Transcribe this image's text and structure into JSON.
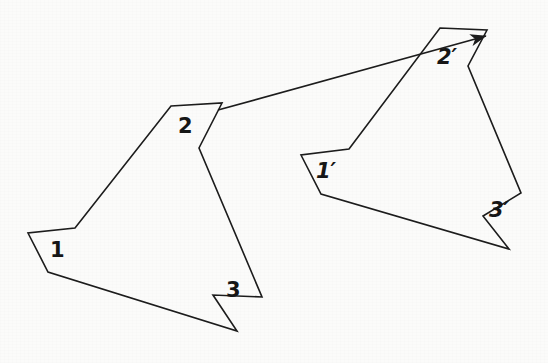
{
  "figure": {
    "background_color": "#fbfbfa",
    "stroke_color": "#1c1c1c",
    "label_color": "#161616",
    "width": 548,
    "height": 363
  },
  "shapes": {
    "source_polygon": {
      "name": "polygon-1-2-3",
      "points": "171,106 222,103 199,148 262,297 213,295 237,331 48,272 28,233 75,228",
      "stroke_width": 1.6
    },
    "image_polygon": {
      "name": "polygon-1p-2p-3p",
      "points": "440,28 487,30 468,66 521,193 483,216 509,249 321,194 301,155 349,149",
      "stroke_width": 1.6
    }
  },
  "arrow": {
    "name": "translation-vector",
    "from_label": "2",
    "to_label": "2'",
    "x1": 218,
    "y1": 110,
    "x2": 486,
    "y2": 36,
    "stroke_width": 1.7,
    "head_length": 14,
    "head_width": 7
  },
  "labels": [
    {
      "id": "label-1",
      "text": "1",
      "x": 50,
      "y": 240,
      "primed": false
    },
    {
      "id": "label-2",
      "text": "2",
      "x": 178,
      "y": 116,
      "primed": false
    },
    {
      "id": "label-3",
      "text": "3",
      "x": 226,
      "y": 280,
      "primed": false
    },
    {
      "id": "label-1p",
      "text": "1′",
      "x": 316,
      "y": 161,
      "primed": true
    },
    {
      "id": "label-2p",
      "text": "2′",
      "x": 437,
      "y": 47,
      "primed": true
    },
    {
      "id": "label-3p",
      "text": "3′",
      "x": 489,
      "y": 200,
      "primed": true
    }
  ]
}
